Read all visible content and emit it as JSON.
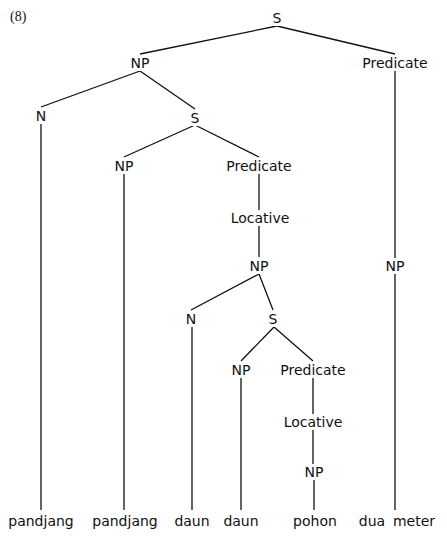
{
  "example_number": "(8)",
  "tree": {
    "nodes": [
      {
        "id": "s0",
        "label": "S",
        "x": 277,
        "y": 18
      },
      {
        "id": "np1",
        "label": "NP",
        "x": 140,
        "y": 63
      },
      {
        "id": "pred1",
        "label": "Predicate",
        "x": 395,
        "y": 63
      },
      {
        "id": "n1",
        "label": "N",
        "x": 41,
        "y": 116
      },
      {
        "id": "s1",
        "label": "S",
        "x": 195,
        "y": 118
      },
      {
        "id": "np2",
        "label": "NP",
        "x": 124,
        "y": 166
      },
      {
        "id": "pred2",
        "label": "Predicate",
        "x": 259,
        "y": 166
      },
      {
        "id": "loc1",
        "label": "Locative",
        "x": 260,
        "y": 218
      },
      {
        "id": "np3",
        "label": "NP",
        "x": 259,
        "y": 266
      },
      {
        "id": "np_r",
        "label": "NP",
        "x": 395,
        "y": 266
      },
      {
        "id": "n2",
        "label": "N",
        "x": 191,
        "y": 319
      },
      {
        "id": "s2",
        "label": "S",
        "x": 273,
        "y": 319
      },
      {
        "id": "np4",
        "label": "NP",
        "x": 241,
        "y": 370
      },
      {
        "id": "pred3",
        "label": "Predicate",
        "x": 313,
        "y": 370
      },
      {
        "id": "loc2",
        "label": "Locative",
        "x": 313,
        "y": 422
      },
      {
        "id": "np5",
        "label": "NP",
        "x": 314,
        "y": 472
      }
    ],
    "leaves": [
      {
        "id": "w1",
        "label": "pandjang",
        "x": 41,
        "y": 521
      },
      {
        "id": "w2",
        "label": "pandjang",
        "x": 125,
        "y": 521
      },
      {
        "id": "w3",
        "label": "daun",
        "x": 192,
        "y": 521
      },
      {
        "id": "w4",
        "label": "daun",
        "x": 241,
        "y": 521
      },
      {
        "id": "w5",
        "label": "pohon",
        "x": 315,
        "y": 521
      },
      {
        "id": "w6",
        "label": "dua",
        "x": 372,
        "y": 521
      },
      {
        "id": "w7",
        "label": "meter",
        "x": 414,
        "y": 521
      }
    ],
    "edges": [
      {
        "from": "s0",
        "to": "np1",
        "x1": 277,
        "y1": 26,
        "x2": 140,
        "y2": 54
      },
      {
        "from": "s0",
        "to": "pred1",
        "x1": 277,
        "y1": 26,
        "x2": 395,
        "y2": 54
      },
      {
        "from": "np1",
        "to": "n1",
        "x1": 140,
        "y1": 71,
        "x2": 41,
        "y2": 107
      },
      {
        "from": "np1",
        "to": "s1",
        "x1": 140,
        "y1": 71,
        "x2": 195,
        "y2": 109
      },
      {
        "from": "n1",
        "to": "w1",
        "x1": 41,
        "y1": 124,
        "x2": 41,
        "y2": 510
      },
      {
        "from": "s1",
        "to": "np2",
        "x1": 195,
        "y1": 125,
        "x2": 124,
        "y2": 157
      },
      {
        "from": "s1",
        "to": "pred2",
        "x1": 195,
        "y1": 125,
        "x2": 259,
        "y2": 157
      },
      {
        "from": "np2",
        "to": "w2",
        "x1": 124,
        "y1": 174,
        "x2": 124,
        "y2": 510
      },
      {
        "from": "pred2",
        "to": "loc1",
        "x1": 259,
        "y1": 174,
        "x2": 259,
        "y2": 210
      },
      {
        "from": "loc1",
        "to": "np3",
        "x1": 259,
        "y1": 226,
        "x2": 259,
        "y2": 257
      },
      {
        "from": "np3",
        "to": "n2",
        "x1": 259,
        "y1": 274,
        "x2": 191,
        "y2": 310
      },
      {
        "from": "np3",
        "to": "s2",
        "x1": 259,
        "y1": 274,
        "x2": 273,
        "y2": 310
      },
      {
        "from": "n2",
        "to": "w3",
        "x1": 192,
        "y1": 327,
        "x2": 192,
        "y2": 510
      },
      {
        "from": "s2",
        "to": "np4",
        "x1": 274,
        "y1": 327,
        "x2": 241,
        "y2": 361
      },
      {
        "from": "s2",
        "to": "pred3",
        "x1": 274,
        "y1": 327,
        "x2": 313,
        "y2": 361
      },
      {
        "from": "np4",
        "to": "w4",
        "x1": 241,
        "y1": 378,
        "x2": 241,
        "y2": 510
      },
      {
        "from": "pred3",
        "to": "loc2",
        "x1": 313,
        "y1": 378,
        "x2": 313,
        "y2": 414
      },
      {
        "from": "loc2",
        "to": "np5",
        "x1": 313,
        "y1": 430,
        "x2": 313,
        "y2": 464
      },
      {
        "from": "np5",
        "to": "w5",
        "x1": 314,
        "y1": 480,
        "x2": 314,
        "y2": 510
      },
      {
        "from": "pred1",
        "to": "np_r",
        "x1": 395,
        "y1": 71,
        "x2": 395,
        "y2": 258
      },
      {
        "from": "np_r",
        "to": "w7",
        "x1": 395,
        "y1": 274,
        "x2": 395,
        "y2": 510
      }
    ]
  },
  "colors": {
    "ink": "#111111",
    "background": "#ffffff"
  }
}
